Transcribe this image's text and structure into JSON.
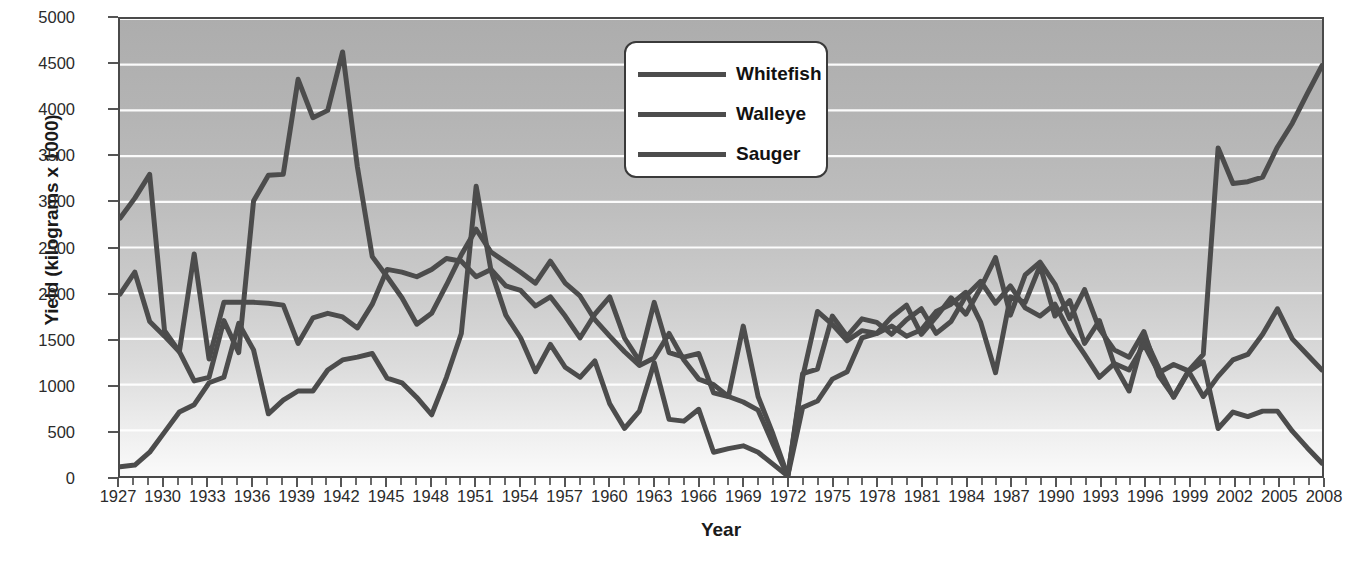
{
  "chart_data": {
    "type": "line",
    "title": "",
    "xlabel": "Year",
    "ylabel": "Yield (kilograms x 1000)",
    "xlim": [
      1927,
      2008
    ],
    "ylim": [
      0,
      5000
    ],
    "grid": "horizontal-white",
    "legend_position": "top-center",
    "y_ticks": [
      0,
      500,
      1000,
      1500,
      2000,
      2500,
      3000,
      3500,
      4000,
      4500,
      5000
    ],
    "x_ticks": [
      1927,
      1930,
      1933,
      1936,
      1939,
      1942,
      1945,
      1948,
      1951,
      1954,
      1957,
      1960,
      1963,
      1966,
      1969,
      1972,
      1975,
      1978,
      1981,
      1984,
      1987,
      1990,
      1993,
      1996,
      1999,
      2002,
      2005,
      2008
    ],
    "x": [
      1927,
      1928,
      1929,
      1930,
      1931,
      1932,
      1933,
      1934,
      1935,
      1936,
      1937,
      1938,
      1939,
      1940,
      1941,
      1942,
      1943,
      1944,
      1945,
      1946,
      1947,
      1948,
      1949,
      1950,
      1951,
      1952,
      1953,
      1954,
      1955,
      1956,
      1957,
      1958,
      1959,
      1960,
      1961,
      1962,
      1963,
      1964,
      1965,
      1966,
      1967,
      1968,
      1969,
      1970,
      1971,
      1972,
      1973,
      1974,
      1975,
      1976,
      1977,
      1978,
      1979,
      1980,
      1981,
      1982,
      1983,
      1984,
      1985,
      1986,
      1987,
      1988,
      1989,
      1990,
      1991,
      1992,
      1993,
      1994,
      1995,
      1996,
      1997,
      1998,
      1999,
      2000,
      2001,
      2002,
      2003,
      2004,
      2005,
      2006,
      2007,
      2008
    ],
    "series": [
      {
        "name": "Whitefish",
        "color": "#4c4c4c",
        "values": [
          2820,
          3040,
          3300,
          1590,
          1360,
          1040,
          1080,
          1700,
          1350,
          3010,
          3290,
          3300,
          4340,
          3920,
          4000,
          4640,
          3380,
          2400,
          2180,
          1950,
          1660,
          1780,
          2090,
          2420,
          2700,
          2450,
          2340,
          2230,
          2110,
          2350,
          2110,
          1970,
          1710,
          1530,
          1360,
          1210,
          1290,
          1560,
          1270,
          1060,
          1000,
          870,
          810,
          720,
          350,
          0,
          1080,
          1800,
          1660,
          1480,
          1590,
          1560,
          1740,
          1870,
          1550,
          1740,
          1950,
          1770,
          2060,
          2390,
          1760,
          2200,
          2340,
          2100,
          1720,
          2040,
          1610,
          1380,
          1300,
          1580,
          1100,
          870,
          1150,
          1330,
          3590,
          3200,
          3220,
          3270,
          3600,
          3860,
          4180,
          4490
        ]
      },
      {
        "name": "Walleye",
        "color": "#4c4c4c",
        "values": [
          1990,
          2230,
          1690,
          1530,
          1360,
          2430,
          1280,
          1900,
          1900,
          1900,
          1890,
          1870,
          1450,
          1730,
          1780,
          1740,
          1620,
          1880,
          2260,
          2230,
          2180,
          2260,
          2380,
          2350,
          2180,
          2260,
          2080,
          2030,
          1860,
          1960,
          1750,
          1510,
          1770,
          1960,
          1510,
          1260,
          1900,
          1350,
          1300,
          1340,
          910,
          870,
          1640,
          870,
          460,
          0,
          750,
          820,
          1060,
          1140,
          1510,
          1560,
          1640,
          1530,
          1600,
          1800,
          1880,
          2010,
          1680,
          1130,
          1960,
          1900,
          2300,
          1750,
          1920,
          1450,
          1700,
          1220,
          930,
          1530,
          1180,
          860,
          1140,
          1250,
          520,
          700,
          650,
          710,
          710,
          490,
          310,
          140
        ]
      },
      {
        "name": "Sauger",
        "color": "#4c4c4c",
        "values": [
          100,
          120,
          260,
          480,
          700,
          780,
          1020,
          1080,
          1670,
          1380,
          680,
          830,
          930,
          930,
          1160,
          1270,
          1300,
          1340,
          1070,
          1020,
          860,
          670,
          1080,
          1560,
          3170,
          2250,
          1760,
          1510,
          1140,
          1440,
          1190,
          1080,
          1260,
          790,
          520,
          710,
          1240,
          620,
          600,
          730,
          260,
          300,
          330,
          260,
          130,
          0,
          1120,
          1170,
          1750,
          1530,
          1720,
          1680,
          1550,
          1710,
          1830,
          1560,
          1690,
          1970,
          2130,
          1890,
          2080,
          1840,
          1750,
          1880,
          1570,
          1330,
          1080,
          1230,
          1160,
          1440,
          1130,
          1220,
          1150,
          870,
          1090,
          1270,
          1330,
          1550,
          1830,
          1500,
          1330,
          1160
        ]
      }
    ]
  },
  "legend": {
    "entries": [
      {
        "label": "Whitefish"
      },
      {
        "label": "Walleye"
      },
      {
        "label": "Sauger"
      }
    ]
  },
  "axes": {
    "y_title": "Yield (kilograms x 1000)",
    "x_title": "Year"
  }
}
